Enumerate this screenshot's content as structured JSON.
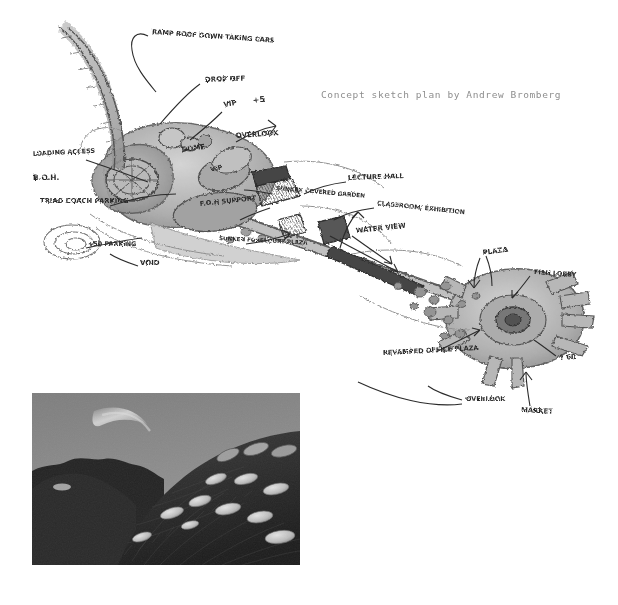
{
  "page": {
    "background_color": "#ffffff",
    "width": 618,
    "height": 605
  },
  "sketch_figure": {
    "caption": "Concept sketch plan by Andrew Bromberg",
    "caption_color": "#8e8e8e",
    "media_type": "hand-drawn architectural concept plan, pencil and ink on white paper",
    "ink_color": "#2b2b2b",
    "pencil_tone": "#9a9a9a",
    "annotations": [
      {
        "id": "ramp-roof",
        "text": "RAMP ROOF DOWN TAKING CARS",
        "x": 152,
        "y": 34
      },
      {
        "id": "drop-off",
        "text": "DROP OFF",
        "x": 205,
        "y": 82
      },
      {
        "id": "vip",
        "text": "VIP",
        "x": 224,
        "y": 107
      },
      {
        "id": "plus-five",
        "text": "+5",
        "x": 253,
        "y": 103
      },
      {
        "id": "overlook-top",
        "text": "OVERLOOK",
        "x": 236,
        "y": 138
      },
      {
        "id": "dome",
        "text": "DOME",
        "x": 182,
        "y": 152
      },
      {
        "id": "vip-two",
        "text": "VIP",
        "x": 211,
        "y": 172
      },
      {
        "id": "loading-access",
        "text": "LOADING ACCESS",
        "x": 33,
        "y": 156
      },
      {
        "id": "boh",
        "text": "B.O.H.",
        "x": 33,
        "y": 180
      },
      {
        "id": "triad-coach-parking",
        "text": "TRIAD COACH PARKING",
        "x": 40,
        "y": 203
      },
      {
        "id": "plus-50-parking",
        "text": "+50 PARKING",
        "x": 88,
        "y": 246
      },
      {
        "id": "void",
        "text": "VOID",
        "x": 140,
        "y": 265
      },
      {
        "id": "foh-support",
        "text": "F.O.H SUPPORT",
        "x": 200,
        "y": 206
      },
      {
        "id": "sunken-covered-garden",
        "text": "SUNKEN COVERED GARDEN",
        "x": 276,
        "y": 190
      },
      {
        "id": "sunken-forecourt-plaza",
        "text": "SUNKEN FORECOURT PLAZA",
        "x": 219,
        "y": 240
      },
      {
        "id": "lecture-hall",
        "text": "LECTURE HALL",
        "x": 348,
        "y": 180
      },
      {
        "id": "classroom-exhibition",
        "text": "CLASSROOM/ EXHIBITION",
        "x": 377,
        "y": 205
      },
      {
        "id": "water-view",
        "text": "WATER VIEW",
        "x": 356,
        "y": 233
      },
      {
        "id": "plaza",
        "text": "PLAZA",
        "x": 483,
        "y": 255
      },
      {
        "id": "fish-lobby",
        "text": "FISH LOBBY",
        "x": 534,
        "y": 274
      },
      {
        "id": "question-60",
        "text": "? 60",
        "x": 560,
        "y": 360
      },
      {
        "id": "revamped-office-plaza",
        "text": "REVAMPED OFFICE PLAZA",
        "x": 383,
        "y": 355
      },
      {
        "id": "overlook-bottom",
        "text": "OVERLOOK",
        "x": 466,
        "y": 401
      },
      {
        "id": "market",
        "text": "MARKET",
        "x": 521,
        "y": 412
      }
    ]
  },
  "photo_figure": {
    "caption": "Precedent image",
    "caption_color": "#8e8e8e",
    "description": "black and white photograph of a grass-covered mound with circular rooflight discs set into the slope",
    "sky_color": "#8a8a8a",
    "hill_color": "#2e2e2e",
    "disc_color": "#cfcfcf"
  }
}
